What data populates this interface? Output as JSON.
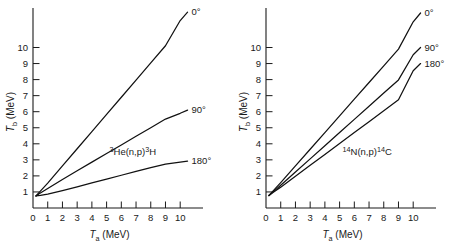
{
  "figure": {
    "background_color": "#ffffff",
    "line_color": "#111111",
    "panel_count": 2
  },
  "chart_data": [
    {
      "type": "line",
      "panel": "left",
      "title": "3He(n,p)3H",
      "title_display": "³He(n,p)³H",
      "xlabel": "Ta (MeV)",
      "xlabel_display": "Tₐ (MeV)",
      "ylabel": "Tb (MeV)",
      "ylabel_display": "Tᵇ (MeV)",
      "xlim": [
        0,
        11.6
      ],
      "ylim": [
        0,
        12.6
      ],
      "xticks": [
        0,
        1,
        2,
        3,
        4,
        5,
        6,
        7,
        8,
        9,
        10
      ],
      "xticklabels": [
        "0",
        "1",
        "2",
        "3",
        "4",
        "5",
        "6",
        "7",
        "8",
        "9",
        "10"
      ],
      "yticks": [
        1,
        2,
        3,
        4,
        5,
        6,
        7,
        8,
        9,
        10
      ],
      "yticklabels": [
        "1",
        "2",
        "3",
        "4",
        "5",
        "6",
        "7",
        "8",
        "9",
        "10"
      ],
      "grid": false,
      "legend_position": "inline-right-end",
      "series": [
        {
          "name": "0°",
          "label": "0°",
          "x": [
            0.2,
            0.5,
            1.0,
            2.0,
            3.0,
            4.0,
            5.0,
            6.0,
            7.0,
            8.0,
            9.0,
            10.0,
            10.5
          ],
          "y": [
            0.75,
            1.05,
            1.55,
            2.62,
            3.69,
            4.76,
            5.83,
            6.9,
            7.97,
            9.04,
            10.11,
            11.68,
            12.2
          ]
        },
        {
          "name": "90°",
          "label": "90°",
          "x": [
            0.2,
            0.5,
            1.0,
            2.0,
            3.0,
            4.0,
            5.0,
            6.0,
            7.0,
            8.0,
            9.0,
            10.0,
            10.5
          ],
          "y": [
            0.75,
            0.93,
            1.22,
            1.78,
            2.32,
            2.86,
            3.4,
            3.93,
            4.47,
            5.0,
            5.54,
            5.9,
            6.1
          ]
        },
        {
          "name": "180°",
          "label": "180°",
          "x": [
            0.2,
            0.5,
            1.0,
            2.0,
            3.0,
            4.0,
            5.0,
            6.0,
            7.0,
            8.0,
            9.0,
            10.0,
            10.5
          ],
          "y": [
            0.75,
            0.78,
            0.86,
            1.08,
            1.32,
            1.56,
            1.8,
            2.04,
            2.28,
            2.52,
            2.74,
            2.86,
            2.92
          ]
        }
      ]
    },
    {
      "type": "line",
      "panel": "right",
      "title": "14N(n,p)14C",
      "title_display": "¹⁴N(n,p)¹⁴C",
      "xlabel": "Ta (MeV)",
      "xlabel_display": "Tₐ (MeV)",
      "ylabel": "Tb (MeV)",
      "ylabel_display": "Tᵇ (MeV)",
      "xlim": [
        0,
        11.6
      ],
      "ylim": [
        0,
        12.6
      ],
      "xticks": [
        0,
        1,
        2,
        3,
        4,
        5,
        6,
        7,
        8,
        9,
        10
      ],
      "xticklabels": [
        "0",
        "1",
        "2",
        "3",
        "4",
        "5",
        "6",
        "7",
        "8",
        "9",
        "10"
      ],
      "yticks": [
        1,
        2,
        3,
        4,
        5,
        6,
        7,
        8,
        9,
        10
      ],
      "yticklabels": [
        "1",
        "2",
        "3",
        "4",
        "5",
        "6",
        "7",
        "8",
        "9",
        "10"
      ],
      "grid": false,
      "legend_position": "inline-right-end",
      "series": [
        {
          "name": "0°",
          "label": "0°",
          "x": [
            0.2,
            0.5,
            1.0,
            2.0,
            3.0,
            4.0,
            5.0,
            6.0,
            7.0,
            8.0,
            9.0,
            10.0,
            10.5
          ],
          "y": [
            0.78,
            1.08,
            1.58,
            2.62,
            3.66,
            4.7,
            5.74,
            6.78,
            7.82,
            8.86,
            9.9,
            11.6,
            12.15
          ]
        },
        {
          "name": "90°",
          "label": "90°",
          "x": [
            0.2,
            0.5,
            1.0,
            2.0,
            3.0,
            4.0,
            5.0,
            6.0,
            7.0,
            8.0,
            9.0,
            10.0,
            10.5
          ],
          "y": [
            0.78,
            1.02,
            1.42,
            2.24,
            3.06,
            3.88,
            4.7,
            5.52,
            6.34,
            7.16,
            7.98,
            9.55,
            10.0
          ]
        },
        {
          "name": "180°",
          "label": "180°",
          "x": [
            0.2,
            0.5,
            1.0,
            2.0,
            3.0,
            4.0,
            5.0,
            6.0,
            7.0,
            8.0,
            9.0,
            10.0,
            10.5
          ],
          "y": [
            0.78,
            0.98,
            1.3,
            1.98,
            2.66,
            3.34,
            4.02,
            4.7,
            5.38,
            6.06,
            6.74,
            8.55,
            9.0
          ]
        }
      ]
    }
  ],
  "left_panel": {
    "reaction": {
      "pre_sup": "3",
      "main": "He(n,p)",
      "mid_sup": "3",
      "tail": "H"
    },
    "xaxis": {
      "symbol": "T",
      "sub": "a",
      "units": "(MeV)",
      "labels": [
        "0",
        "1",
        "2",
        "3",
        "4",
        "5",
        "6",
        "7",
        "8",
        "9",
        "10"
      ]
    },
    "yaxis": {
      "symbol": "T",
      "sub": "b",
      "units": "(MeV)",
      "labels": [
        "1",
        "2",
        "3",
        "4",
        "5",
        "6",
        "7",
        "8",
        "9",
        "10"
      ]
    },
    "curve_labels": [
      "0°",
      "90°",
      "180°"
    ]
  },
  "right_panel": {
    "reaction": {
      "pre_sup": "14",
      "main": "N(n,p)",
      "mid_sup": "14",
      "tail": "C"
    },
    "xaxis": {
      "symbol": "T",
      "sub": "a",
      "units": "(MeV)",
      "labels": [
        "0",
        "1",
        "2",
        "3",
        "4",
        "5",
        "6",
        "7",
        "8",
        "9",
        "10"
      ]
    },
    "yaxis": {
      "symbol": "T",
      "sub": "b",
      "units": "(MeV)",
      "labels": [
        "1",
        "2",
        "3",
        "4",
        "5",
        "6",
        "7",
        "8",
        "9",
        "10"
      ]
    },
    "curve_labels": [
      "0°",
      "90°",
      "180°"
    ]
  }
}
